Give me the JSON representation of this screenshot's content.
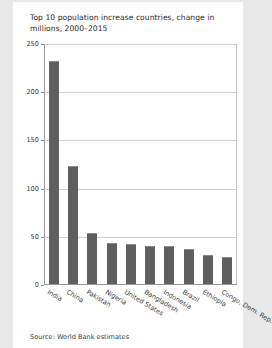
{
  "figure": {
    "title": "Top 10 population increase countries, change in millions, 2000–2015",
    "source": "Source: World Bank estimates"
  },
  "colors": {
    "bar": "#5f5f5f",
    "grid": "#cfcfcf",
    "axis": "#9a9a9a",
    "panel_background": "#ffffff",
    "page_background": "#e9e9e9",
    "text": "#2b2b2b"
  },
  "chart_data": {
    "type": "bar",
    "title": "Top 10 population increase countries, change in millions, 2000–2015",
    "subtitle": "",
    "xlabel": "",
    "ylabel": "",
    "ylim": [
      0,
      250
    ],
    "yticks": [
      0,
      50,
      100,
      150,
      200,
      250
    ],
    "ytick_labels": [
      "0",
      "50",
      "100",
      "150",
      "200",
      "250"
    ],
    "grid": true,
    "legend": false,
    "legend_position": "none",
    "categories": [
      "India",
      "China",
      "Pakistan",
      "Nigeria",
      "United States",
      "Bangladesh",
      "Indonesia",
      "Brazil",
      "Ethiopia",
      "Congo, Dem. Rep."
    ],
    "values": [
      232,
      123,
      54,
      44,
      43,
      40,
      40,
      37,
      31,
      29
    ],
    "annotations": [
      "Source: World Bank estimates"
    ]
  }
}
